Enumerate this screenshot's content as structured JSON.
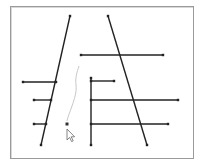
{
  "canvas": {
    "background": "#ffffff",
    "border_color": "#9a9a9a",
    "stroke_color": "#222222",
    "sketch_color": "#c8c8c8",
    "segments": [
      {
        "id": "left-slant",
        "x1": 70,
        "y1": 16,
        "x2": 41,
        "y2": 145
      },
      {
        "id": "right-slant",
        "x1": 108,
        "y1": 16,
        "x2": 147,
        "y2": 145
      },
      {
        "id": "top-horizontal",
        "x1": 81,
        "y1": 55,
        "x2": 163,
        "y2": 55
      },
      {
        "id": "left-horizontal-1",
        "x1": 23,
        "y1": 82,
        "x2": 56,
        "y2": 82
      },
      {
        "id": "left-horizontal-2",
        "x1": 34,
        "y1": 100,
        "x2": 51,
        "y2": 100
      },
      {
        "id": "left-horizontal-3",
        "x1": 34,
        "y1": 124,
        "x2": 46,
        "y2": 124
      },
      {
        "id": "vertical",
        "x1": 91,
        "y1": 78,
        "x2": 91,
        "y2": 145
      },
      {
        "id": "right-horizontal-1",
        "x1": 91,
        "y1": 81,
        "x2": 114,
        "y2": 81
      },
      {
        "id": "right-horizontal-2",
        "x1": 91,
        "y1": 100,
        "x2": 178,
        "y2": 100
      },
      {
        "id": "right-horizontal-3",
        "x1": 91,
        "y1": 124,
        "x2": 168,
        "y2": 124
      }
    ],
    "pending_point": {
      "x": 67,
      "y": 124
    },
    "freehand_path": "M79,66 C77,72 75,78 76,85 C77,92 74,100 72,106 C70,112 68,116 67,121",
    "cursor": {
      "x": 67,
      "y": 129,
      "type": "arrow"
    }
  }
}
